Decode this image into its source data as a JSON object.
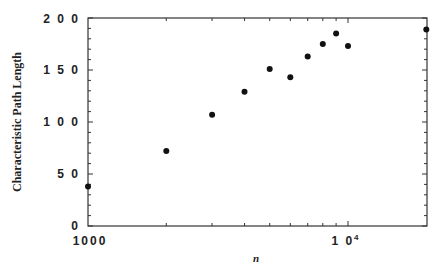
{
  "chart_data": {
    "type": "scatter",
    "title": "",
    "xlabel": "n",
    "ylabel": "Characteristic Path Length",
    "xscale": "log",
    "xlim": [
      1000,
      20000
    ],
    "ylim": [
      0,
      200
    ],
    "grid": false,
    "legend": null,
    "x_tick_labels": [
      "1000",
      "10⁴"
    ],
    "y_tick_labels": [
      "0",
      "50",
      "100",
      "150",
      "200"
    ],
    "series": [
      {
        "name": "data",
        "x": [
          1000,
          2000,
          3000,
          4000,
          5000,
          6000,
          7000,
          8000,
          9000,
          10000,
          20000
        ],
        "y": [
          38,
          72,
          107,
          129,
          151,
          143,
          163,
          175,
          185,
          173,
          189
        ]
      }
    ]
  },
  "labels": {
    "ylabel": "Characteristic Path Length",
    "xlabel": "n",
    "x_ticks": [
      {
        "value": 1000,
        "label": "1000"
      },
      {
        "value": 10000,
        "label": "1 0",
        "sup": "4"
      }
    ],
    "y_ticks": [
      "0",
      "5 0",
      "1 0 0",
      "1 5 0",
      "2 0 0"
    ]
  }
}
